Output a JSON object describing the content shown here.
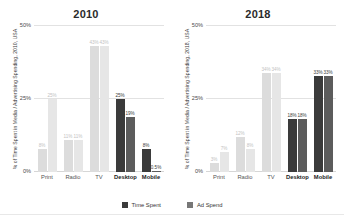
{
  "chart_data": [
    {
      "type": "bar",
      "title": "2010",
      "categories": [
        "Print",
        "Radio",
        "TV",
        "Desktop",
        "Mobile"
      ],
      "series": [
        {
          "name": "Time Spent",
          "values": [
            8,
            11,
            43,
            25,
            8
          ],
          "color": "#3b3b3b"
        },
        {
          "name": "Ad Spend",
          "values": [
            25,
            11,
            43,
            19,
            0.5
          ],
          "color": "#6e6e6e"
        }
      ],
      "labels": [
        [
          "8%",
          "25%"
        ],
        [
          "11%",
          "11%"
        ],
        [
          "43%",
          "43%"
        ],
        [
          "25%",
          "19%"
        ],
        [
          "8%",
          "0.5%"
        ]
      ],
      "ylabel": "% of Time Spent in Media / Advertising Spending, 2010, USA",
      "xlabel": "",
      "ylim": [
        0,
        50
      ],
      "yticks": [
        0,
        25,
        50
      ],
      "ytick_labels": [
        "0%",
        "25%",
        "50%"
      ],
      "grid": true,
      "highlight_categories": [
        "Desktop",
        "Mobile"
      ]
    },
    {
      "type": "bar",
      "title": "2018",
      "categories": [
        "Print",
        "Radio",
        "TV",
        "Desktop",
        "Mobile"
      ],
      "series": [
        {
          "name": "Time Spent",
          "values": [
            3,
            12,
            34,
            18,
            33
          ],
          "color": "#3b3b3b"
        },
        {
          "name": "Ad Spend",
          "values": [
            7,
            8,
            34,
            18,
            33
          ],
          "color": "#6e6e6e"
        }
      ],
      "labels": [
        [
          "3%",
          "7%"
        ],
        [
          "12%",
          "8%"
        ],
        [
          "34%",
          "34%"
        ],
        [
          "18%",
          "18%"
        ],
        [
          "33%",
          "33%"
        ]
      ],
      "ylabel": "% of Time Spent in Media / Advertising Spending, 2018, USA",
      "xlabel": "",
      "ylim": [
        0,
        50
      ],
      "yticks": [
        0,
        25,
        50
      ],
      "ytick_labels": [
        "0%",
        "25%",
        "50%"
      ],
      "grid": true,
      "highlight_categories": [
        "Desktop",
        "Mobile"
      ]
    }
  ],
  "legend": {
    "position": "bottom-center",
    "items": [
      {
        "label": "Time Spent",
        "color": "#3b3b3b"
      },
      {
        "label": "Ad Spend",
        "color": "#777777"
      }
    ]
  },
  "colors": {
    "background": "#ffffff",
    "grid": "#e2e2e2",
    "text": "#333333",
    "muted_bar": "#dcdcdc",
    "muted_bar_alt": "#e6e6e6"
  }
}
